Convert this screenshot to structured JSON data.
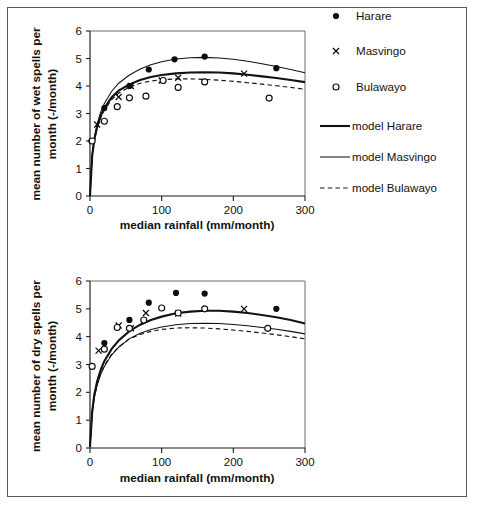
{
  "figure": {
    "panels": [
      {
        "id": "wet-spells",
        "chart_data": {
          "type": "scatter",
          "title": "",
          "xlabel": "median rainfall (mm/month)",
          "ylabel": "mean number of wet spells per month (-/month)",
          "ylabel_line1": "mean number of wet spells per",
          "ylabel_line2": "month (-/month)",
          "xlim": [
            0,
            300
          ],
          "ylim": [
            0,
            6
          ],
          "xticks": [
            0,
            100,
            200,
            300
          ],
          "yticks": [
            0,
            1,
            2,
            3,
            4,
            5,
            6
          ],
          "grid": false,
          "legend_position": "right",
          "series": [
            {
              "name": "Harare",
              "marker": "filled-circle",
              "x": [
                2,
                20,
                55,
                82,
                118,
                160,
                260
              ],
              "y": [
                2.0,
                3.2,
                4.0,
                4.6,
                4.97,
                5.07,
                4.65
              ]
            },
            {
              "name": "Masvingo",
              "marker": "cross",
              "x": [
                10,
                40,
                57,
                100,
                123,
                215
              ],
              "y": [
                2.6,
                3.6,
                4.0,
                4.2,
                4.3,
                4.45
              ]
            },
            {
              "name": "Bulawayo",
              "marker": "open-circle",
              "x": [
                3,
                20,
                38,
                55,
                78,
                102,
                123,
                160,
                250
              ],
              "y": [
                2.0,
                2.72,
                3.25,
                3.57,
                3.63,
                4.2,
                3.95,
                4.15,
                3.56
              ]
            },
            {
              "name": "model Harare",
              "marker": "line-thick",
              "x": [
                0,
                3,
                6,
                10,
                15,
                20,
                30,
                40,
                55,
                70,
                85,
                100,
                120,
                140,
                160,
                180,
                200,
                220,
                240,
                260,
                280,
                300
              ],
              "y": [
                0.0,
                1.45,
                2.05,
                2.52,
                2.92,
                3.2,
                3.58,
                3.83,
                4.06,
                4.22,
                4.33,
                4.4,
                4.46,
                4.49,
                4.5,
                4.49,
                4.46,
                4.41,
                4.35,
                4.29,
                4.22,
                4.14
              ]
            },
            {
              "name": "model Masvingo",
              "marker": "line-thin",
              "x": [
                0,
                3,
                6,
                10,
                15,
                20,
                30,
                40,
                55,
                70,
                85,
                100,
                120,
                140,
                160,
                180,
                200,
                220,
                240,
                260,
                280,
                300
              ],
              "y": [
                0.0,
                1.5,
                2.12,
                2.62,
                3.06,
                3.36,
                3.8,
                4.1,
                4.4,
                4.62,
                4.77,
                4.88,
                4.98,
                5.03,
                5.04,
                5.02,
                4.97,
                4.9,
                4.81,
                4.71,
                4.6,
                4.48
              ]
            },
            {
              "name": "model Bulawayo",
              "marker": "line-dashed",
              "x": [
                0,
                3,
                6,
                10,
                15,
                20,
                30,
                40,
                55,
                70,
                85,
                100,
                120,
                140,
                160,
                180,
                200,
                220,
                240,
                260,
                280,
                300
              ],
              "y": [
                0.0,
                1.42,
                2.0,
                2.46,
                2.85,
                3.12,
                3.5,
                3.74,
                3.96,
                4.1,
                4.18,
                4.23,
                4.26,
                4.26,
                4.24,
                4.21,
                4.17,
                4.12,
                4.07,
                4.01,
                3.95,
                3.88
              ]
            }
          ]
        }
      },
      {
        "id": "dry-spells",
        "chart_data": {
          "type": "scatter",
          "title": "",
          "xlabel": "median rainfall (mm/month)",
          "ylabel": "mean number of dry spells per month (-/month)",
          "ylabel_line1": "mean number of dry spells per",
          "ylabel_line2": "month (-/month)",
          "xlim": [
            0,
            300
          ],
          "ylim": [
            0,
            6
          ],
          "xticks": [
            0,
            100,
            200,
            300
          ],
          "yticks": [
            0,
            1,
            2,
            3,
            4,
            5,
            6
          ],
          "grid": false,
          "legend_position": "none",
          "series": [
            {
              "name": "Harare",
              "marker": "filled-circle",
              "x": [
                20,
                55,
                82,
                120,
                160,
                260
              ],
              "y": [
                3.77,
                4.6,
                5.22,
                5.57,
                5.55,
                5.0
              ]
            },
            {
              "name": "Masvingo",
              "marker": "cross",
              "x": [
                12,
                40,
                57,
                78,
                123,
                215
              ],
              "y": [
                3.5,
                4.4,
                4.3,
                4.85,
                4.83,
                5.0
              ]
            },
            {
              "name": "Bulawayo",
              "marker": "open-circle",
              "x": [
                3,
                20,
                38,
                55,
                75,
                100,
                123,
                160,
                248
              ],
              "y": [
                2.93,
                3.55,
                4.33,
                4.3,
                4.6,
                5.03,
                4.85,
                5.0,
                4.3
              ]
            },
            {
              "name": "model Harare",
              "marker": "line-thick",
              "x": [
                0,
                3,
                6,
                10,
                15,
                20,
                30,
                40,
                55,
                70,
                85,
                100,
                120,
                140,
                160,
                180,
                200,
                220,
                240,
                260,
                280,
                300
              ],
              "y": [
                0.05,
                1.3,
                1.92,
                2.4,
                2.82,
                3.12,
                3.55,
                3.86,
                4.2,
                4.43,
                4.6,
                4.72,
                4.84,
                4.9,
                4.93,
                4.93,
                4.9,
                4.85,
                4.78,
                4.7,
                4.6,
                4.47
              ]
            },
            {
              "name": "model Masvingo",
              "marker": "line-thin",
              "x": [
                0,
                3,
                6,
                10,
                15,
                20,
                30,
                40,
                55,
                70,
                85,
                100,
                120,
                140,
                160,
                180,
                200,
                220,
                240,
                260,
                280,
                300
              ],
              "y": [
                0.05,
                1.22,
                1.8,
                2.26,
                2.65,
                2.93,
                3.34,
                3.62,
                3.93,
                4.12,
                4.26,
                4.35,
                4.43,
                4.47,
                4.48,
                4.47,
                4.44,
                4.39,
                4.33,
                4.27,
                4.19,
                4.1
              ]
            },
            {
              "name": "model Bulawayo",
              "marker": "line-dashed",
              "x": [
                0,
                3,
                6,
                10,
                15,
                20,
                30,
                40,
                55,
                70,
                85,
                100,
                120,
                140,
                160,
                180,
                200,
                220,
                240,
                260,
                280,
                300
              ],
              "y": [
                0.05,
                1.25,
                1.83,
                2.3,
                2.68,
                2.96,
                3.36,
                3.63,
                3.92,
                4.08,
                4.19,
                4.26,
                4.31,
                4.32,
                4.31,
                4.28,
                4.24,
                4.19,
                4.13,
                4.07,
                4.0,
                3.92
              ]
            }
          ]
        }
      }
    ],
    "legend": {
      "items": [
        {
          "label": "Harare",
          "marker": "filled-circle"
        },
        {
          "label": "Masvingo",
          "marker": "cross"
        },
        {
          "label": "Bulawayo",
          "marker": "open-circle"
        },
        {
          "label": "model Harare",
          "marker": "line-thick"
        },
        {
          "label": "model Masvingo",
          "marker": "line-thin"
        },
        {
          "label": "model Bulawayo",
          "marker": "line-dashed"
        }
      ]
    },
    "colors": {
      "ink": "#111111",
      "frame": "#5a5a5a",
      "background": "#ffffff"
    }
  }
}
